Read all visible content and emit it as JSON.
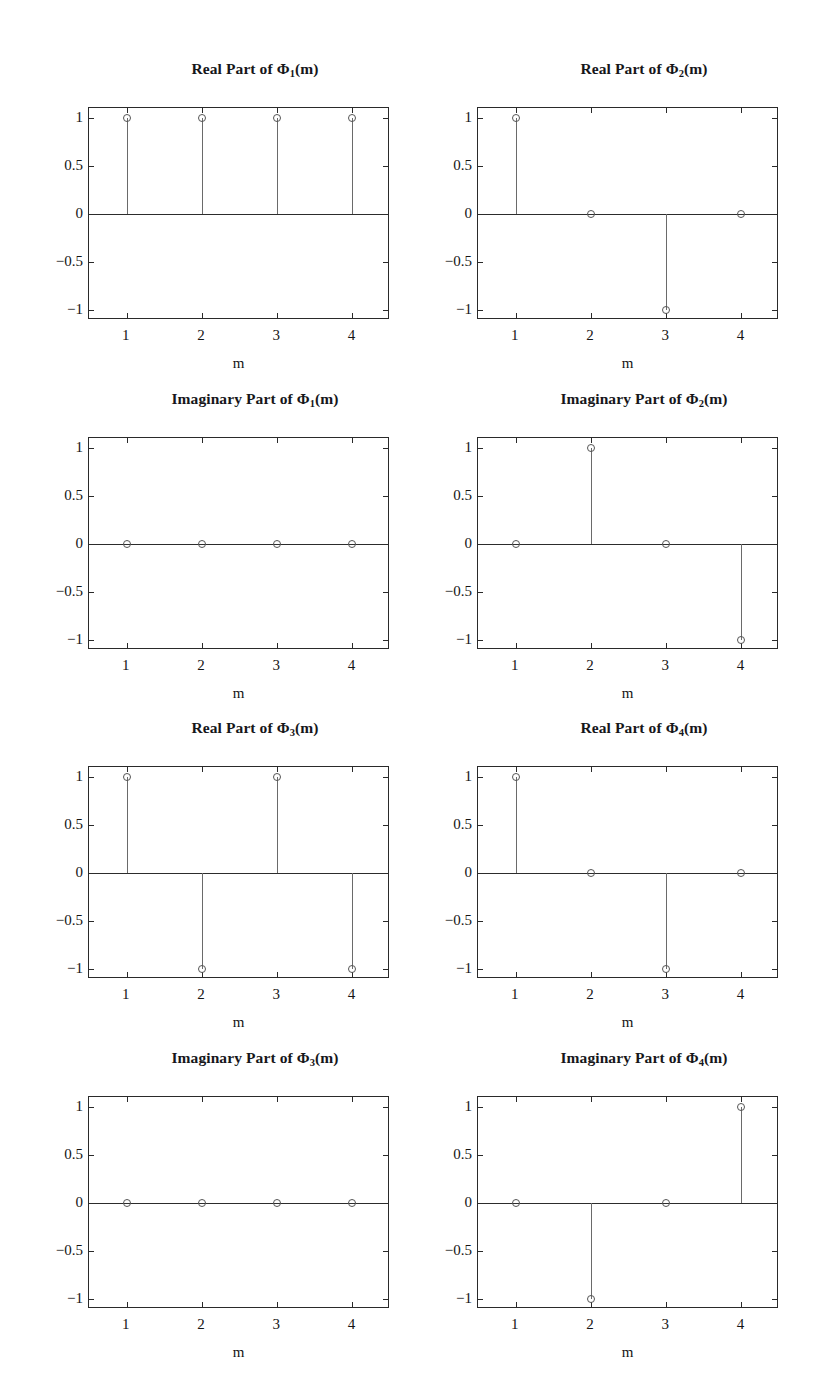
{
  "figure": {
    "background_color": "#ffffff",
    "axis_color": "#2a2a2a",
    "stem_color": "#6a6a6a",
    "marker_color": "#555555",
    "rows": 4,
    "cols": 2,
    "xlabel": "m",
    "x_tick_labels": [
      "1",
      "2",
      "3",
      "4"
    ],
    "y_tick_labels": [
      "1",
      "0.5",
      "0",
      "−0.5",
      "−1"
    ]
  },
  "panels": [
    {
      "id": "real-phi-1",
      "title_prefix": "Real Part of Φ",
      "title_sub": "1",
      "title_suffix": "(m)",
      "title_plain": "Real Part of Φ1(m)"
    },
    {
      "id": "real-phi-2",
      "title_prefix": "Real Part of Φ",
      "title_sub": "2",
      "title_suffix": "(m)",
      "title_plain": "Real Part of Φ2(m)"
    },
    {
      "id": "imag-phi-1",
      "title_prefix": "Imaginary Part of Φ",
      "title_sub": "1",
      "title_suffix": "(m)",
      "title_plain": "Imaginary Part of Φ1(m)"
    },
    {
      "id": "imag-phi-2",
      "title_prefix": "Imaginary Part of Φ",
      "title_sub": "2",
      "title_suffix": "(m)",
      "title_plain": "Imaginary Part of Φ2(m)"
    },
    {
      "id": "real-phi-3",
      "title_prefix": "Real Part of Φ",
      "title_sub": "3",
      "title_suffix": "(m)",
      "title_plain": "Real Part of Φ3(m)"
    },
    {
      "id": "real-phi-4",
      "title_prefix": "Real Part of Φ",
      "title_sub": "4",
      "title_suffix": "(m)",
      "title_plain": "Real Part of Φ4(m)"
    },
    {
      "id": "imag-phi-3",
      "title_prefix": "Imaginary Part of Φ",
      "title_sub": "3",
      "title_suffix": "(m)",
      "title_plain": "Imaginary Part of Φ3(m)"
    },
    {
      "id": "imag-phi-4",
      "title_prefix": "Imaginary Part of Φ",
      "title_sub": "4",
      "title_suffix": "(m)",
      "title_plain": "Imaginary Part of Φ4(m)"
    }
  ],
  "chart_data": [
    {
      "type": "scatter",
      "plot_style": "stem",
      "title": "Real Part of Φ1(m)",
      "xlabel": "m",
      "ylabel": "",
      "x": [
        1,
        2,
        3,
        4
      ],
      "values": [
        1,
        1,
        1,
        1
      ],
      "xlim": [
        0.5,
        4.5
      ],
      "ylim": [
        -1.1,
        1.1
      ],
      "xticks": [
        1,
        2,
        3,
        4
      ],
      "yticks": [
        -1,
        -0.5,
        0,
        0.5,
        1
      ],
      "grid": false,
      "legend": null
    },
    {
      "type": "scatter",
      "plot_style": "stem",
      "title": "Real Part of Φ2(m)",
      "xlabel": "m",
      "ylabel": "",
      "x": [
        1,
        2,
        3,
        4
      ],
      "values": [
        1,
        0,
        -1,
        0
      ],
      "xlim": [
        0.5,
        4.5
      ],
      "ylim": [
        -1.1,
        1.1
      ],
      "xticks": [
        1,
        2,
        3,
        4
      ],
      "yticks": [
        -1,
        -0.5,
        0,
        0.5,
        1
      ],
      "grid": false,
      "legend": null
    },
    {
      "type": "scatter",
      "plot_style": "stem",
      "title": "Imaginary Part of Φ1(m)",
      "xlabel": "m",
      "ylabel": "",
      "x": [
        1,
        2,
        3,
        4
      ],
      "values": [
        0,
        0,
        0,
        0
      ],
      "xlim": [
        0.5,
        4.5
      ],
      "ylim": [
        -1.1,
        1.1
      ],
      "xticks": [
        1,
        2,
        3,
        4
      ],
      "yticks": [
        -1,
        -0.5,
        0,
        0.5,
        1
      ],
      "grid": false,
      "legend": null
    },
    {
      "type": "scatter",
      "plot_style": "stem",
      "title": "Imaginary Part of Φ2(m)",
      "xlabel": "m",
      "ylabel": "",
      "x": [
        1,
        2,
        3,
        4
      ],
      "values": [
        0,
        1,
        0,
        -1
      ],
      "xlim": [
        0.5,
        4.5
      ],
      "ylim": [
        -1.1,
        1.1
      ],
      "xticks": [
        1,
        2,
        3,
        4
      ],
      "yticks": [
        -1,
        -0.5,
        0,
        0.5,
        1
      ],
      "grid": false,
      "legend": null
    },
    {
      "type": "scatter",
      "plot_style": "stem",
      "title": "Real Part of Φ3(m)",
      "xlabel": "m",
      "ylabel": "",
      "x": [
        1,
        2,
        3,
        4
      ],
      "values": [
        1,
        -1,
        1,
        -1
      ],
      "xlim": [
        0.5,
        4.5
      ],
      "ylim": [
        -1.1,
        1.1
      ],
      "xticks": [
        1,
        2,
        3,
        4
      ],
      "yticks": [
        -1,
        -0.5,
        0,
        0.5,
        1
      ],
      "grid": false,
      "legend": null
    },
    {
      "type": "scatter",
      "plot_style": "stem",
      "title": "Real Part of Φ4(m)",
      "xlabel": "m",
      "ylabel": "",
      "x": [
        1,
        2,
        3,
        4
      ],
      "values": [
        1,
        0,
        -1,
        0
      ],
      "xlim": [
        0.5,
        4.5
      ],
      "ylim": [
        -1.1,
        1.1
      ],
      "xticks": [
        1,
        2,
        3,
        4
      ],
      "yticks": [
        -1,
        -0.5,
        0,
        0.5,
        1
      ],
      "grid": false,
      "legend": null
    },
    {
      "type": "scatter",
      "plot_style": "stem",
      "title": "Imaginary Part of Φ3(m)",
      "xlabel": "m",
      "ylabel": "",
      "x": [
        1,
        2,
        3,
        4
      ],
      "values": [
        0,
        0,
        0,
        0
      ],
      "xlim": [
        0.5,
        4.5
      ],
      "ylim": [
        -1.1,
        1.1
      ],
      "xticks": [
        1,
        2,
        3,
        4
      ],
      "yticks": [
        -1,
        -0.5,
        0,
        0.5,
        1
      ],
      "grid": false,
      "legend": null
    },
    {
      "type": "scatter",
      "plot_style": "stem",
      "title": "Imaginary Part of Φ4(m)",
      "xlabel": "m",
      "ylabel": "",
      "x": [
        1,
        2,
        3,
        4
      ],
      "values": [
        0,
        -1,
        0,
        1
      ],
      "xlim": [
        0.5,
        4.5
      ],
      "ylim": [
        -1.1,
        1.1
      ],
      "xticks": [
        1,
        2,
        3,
        4
      ],
      "yticks": [
        -1,
        -0.5,
        0,
        0.5,
        1
      ],
      "grid": false,
      "legend": null
    }
  ]
}
